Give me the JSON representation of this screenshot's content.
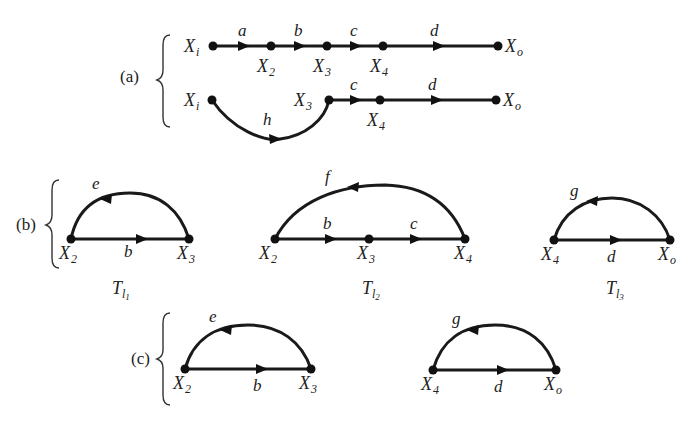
{
  "sections": {
    "a": {
      "label": "(a)"
    },
    "b": {
      "label": "(b)"
    },
    "c": {
      "label": "(c)"
    }
  },
  "graph_a1": {
    "nodes": [
      "X",
      "X",
      "X",
      "X",
      "X"
    ],
    "subs": [
      "i",
      "2",
      "3",
      "4",
      "o"
    ],
    "edges": [
      "a",
      "b",
      "c",
      "d"
    ]
  },
  "graph_a2": {
    "nodes": [
      "X",
      "X",
      "X",
      "X"
    ],
    "subs": [
      "i",
      "3",
      "4",
      "o"
    ],
    "edges": [
      "h",
      "c",
      "d"
    ]
  },
  "loop_b1": {
    "nodes": [
      "X",
      "X"
    ],
    "subs": [
      "2",
      "3"
    ],
    "forward": "b",
    "feedback": "e",
    "title": "T",
    "title_sub": "l",
    "title_subsub": "1"
  },
  "loop_b2": {
    "nodes": [
      "X",
      "X",
      "X"
    ],
    "subs": [
      "2",
      "3",
      "4"
    ],
    "forward": [
      "b",
      "c"
    ],
    "feedback": "f",
    "title": "T",
    "title_sub": "l",
    "title_subsub": "2"
  },
  "loop_b3": {
    "nodes": [
      "X",
      "X"
    ],
    "subs": [
      "4",
      "o"
    ],
    "forward": "d",
    "feedback": "g",
    "title": "T",
    "title_sub": "l",
    "title_subsub": "3"
  },
  "loop_c1": {
    "nodes": [
      "X",
      "X"
    ],
    "subs": [
      "2",
      "3"
    ],
    "forward": "b",
    "feedback": "e"
  },
  "loop_c2": {
    "nodes": [
      "X",
      "X"
    ],
    "subs": [
      "4",
      "o"
    ],
    "forward": "d",
    "feedback": "g"
  }
}
